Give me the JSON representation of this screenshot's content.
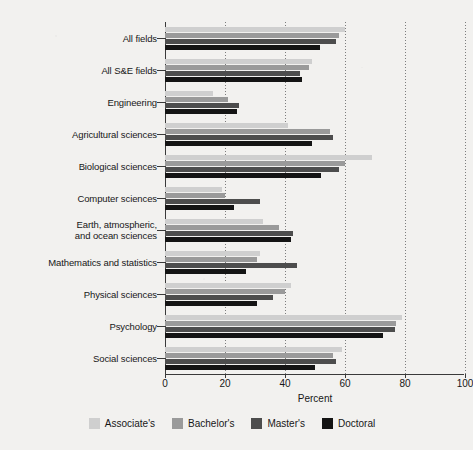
{
  "chart_data": {
    "type": "bar",
    "orientation": "horizontal",
    "title": "",
    "xlabel": "Percent",
    "ylabel": "",
    "xlim": [
      0,
      100
    ],
    "xticks": [
      0,
      20,
      40,
      60,
      80,
      100
    ],
    "xtick_labels": [
      "0",
      "20",
      "40",
      "60",
      "80",
      "100"
    ],
    "grid": true,
    "grid_axis": "x",
    "legend_position": "bottom",
    "categories": [
      "All fields",
      "All S&E fields",
      "Engineering",
      "Agricultural sciences",
      "Biological sciences",
      "Computer sciences",
      "Earth, atmospheric,\nand ocean sciences",
      "Mathematics and statistics",
      "Physical sciences",
      "Psychology",
      "Social sciences"
    ],
    "series": [
      {
        "name": "Associate's",
        "color": "#cfcfcf",
        "values": [
          60.0,
          49.0,
          16.0,
          41.0,
          69.0,
          19.0,
          32.5,
          31.5,
          42.0,
          79.0,
          59.0
        ]
      },
      {
        "name": "Bachelor's",
        "color": "#9a9a9a",
        "values": [
          58.0,
          48.0,
          21.0,
          55.0,
          60.0,
          20.0,
          38.0,
          30.5,
          40.0,
          77.0,
          56.0
        ]
      },
      {
        "name": "Master's",
        "color": "#4d4d4d",
        "values": [
          57.0,
          45.0,
          24.5,
          56.0,
          58.0,
          31.5,
          42.5,
          44.0,
          36.0,
          76.5,
          57.0
        ]
      },
      {
        "name": "Doctoral",
        "color": "#141414",
        "values": [
          51.5,
          45.5,
          24.0,
          49.0,
          52.0,
          23.0,
          42.0,
          27.0,
          30.5,
          72.5,
          50.0
        ]
      }
    ]
  },
  "legend": {
    "items": [
      {
        "label": "Associate's",
        "color": "#cfcfcf"
      },
      {
        "label": "Bachelor's",
        "color": "#9a9a9a"
      },
      {
        "label": "Master's",
        "color": "#4d4d4d"
      },
      {
        "label": "Doctoral",
        "color": "#141414"
      }
    ]
  },
  "axis": {
    "x_title": "Percent"
  }
}
